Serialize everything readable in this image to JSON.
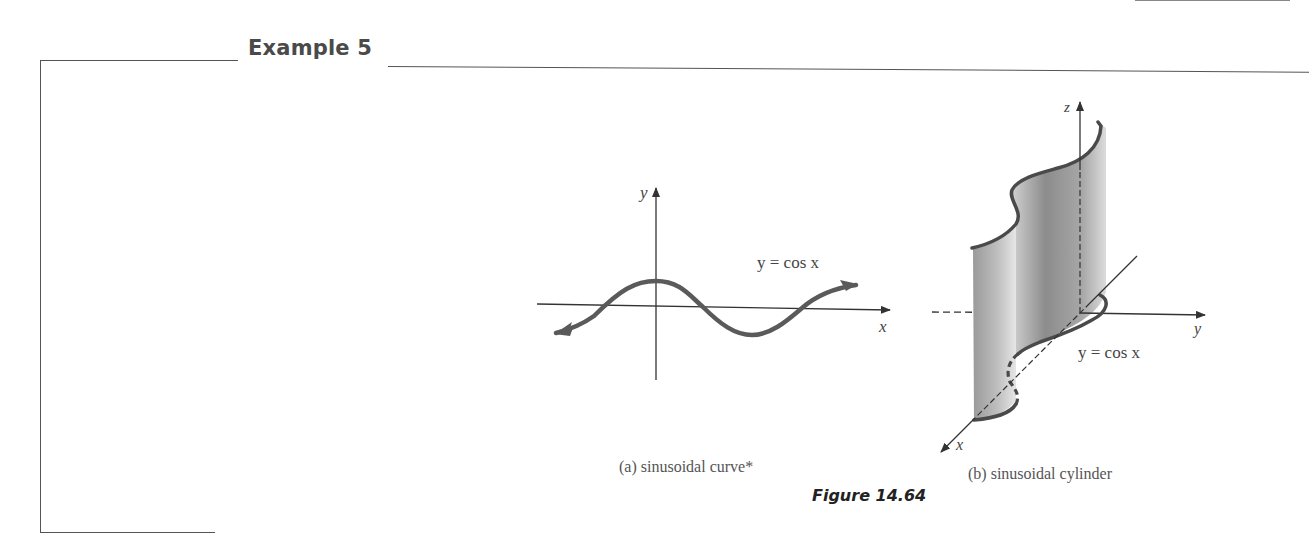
{
  "example": {
    "title": "Example 5"
  },
  "figure": {
    "label": "Figure 14.64",
    "panel_a": {
      "caption": "(a) sinusoidal curve*",
      "axis_x_label": "x",
      "axis_y_label": "y",
      "equation": "y = cos x"
    },
    "panel_b": {
      "caption": "(b) sinusoidal cylinder",
      "axis_x_label": "x",
      "axis_y_label": "y",
      "axis_z_label": "z",
      "equation": "y = cos x"
    }
  },
  "colors": {
    "curve": "#5a5a5a",
    "surface_dark": "#8a8a8a",
    "surface_light": "#d8d8d8",
    "rule": "#555555"
  }
}
